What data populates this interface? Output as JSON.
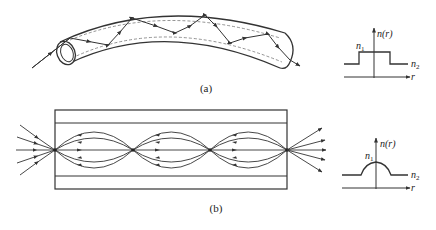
{
  "figure": {
    "panel_a": {
      "caption": "(a)",
      "description": "step-index fiber: zig-zag ray bouncing by total internal reflection in a curved tube",
      "graph": {
        "ylabel": "n(r)",
        "xlabel": "r",
        "core_label": "n",
        "core_sub": "1",
        "clad_label": "n",
        "clad_sub": "2",
        "profile": "step"
      }
    },
    "panel_b": {
      "caption": "(b)",
      "description": "graded-index fiber: sinusoidal rays periodically refocusing along the axis",
      "graph": {
        "ylabel": "n(r)",
        "xlabel": "r",
        "core_label": "n",
        "core_sub": "1",
        "clad_label": "n",
        "clad_sub": "2",
        "profile": "graded (parabolic)"
      }
    },
    "colors": {
      "line": "#333333",
      "dashed": "#777777",
      "background": "#ffffff"
    }
  }
}
